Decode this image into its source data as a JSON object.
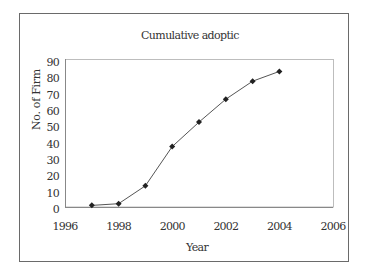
{
  "chart_data": {
    "type": "line",
    "title": "Cumulative adoptic",
    "xlabel": "Year",
    "ylabel": "No. of Firm",
    "x": [
      1997,
      1998,
      1999,
      2000,
      2001,
      2002,
      2003,
      2004
    ],
    "series": [
      {
        "name": "Cumulative adoption",
        "values": [
          1,
          2,
          13,
          37,
          52,
          66,
          77,
          83
        ],
        "marker": "diamond",
        "color": "#222222"
      }
    ],
    "xlim": [
      1996,
      2006
    ],
    "ylim": [
      0,
      90
    ],
    "xticks": [
      "1996",
      "1998",
      "2000",
      "2002",
      "2004",
      "2006"
    ],
    "yticks": [
      "0",
      "10",
      "20",
      "30",
      "40",
      "50",
      "60",
      "70",
      "80",
      "90"
    ],
    "grid": false,
    "legend": "none"
  }
}
